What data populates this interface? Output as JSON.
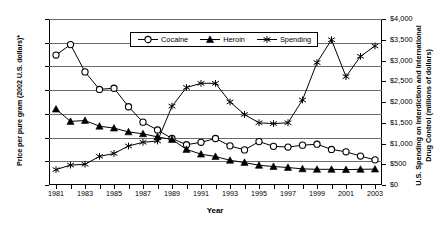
{
  "chart_data": {
    "type": "line",
    "title": "",
    "xlabel": "Year",
    "ylabel": "Price per pure gram (2002 U.S. dollars)*",
    "ylabel_right": "U.S. Spending on Interdiction and International Drug Control (millions of dollars)",
    "x": [
      1981,
      1982,
      1983,
      1984,
      1985,
      1986,
      1987,
      1988,
      1989,
      1990,
      1991,
      1992,
      1993,
      1994,
      1995,
      1996,
      1997,
      1998,
      1999,
      2000,
      2001,
      2002,
      2003
    ],
    "xtick_labels": [
      "1981",
      "1983",
      "1985",
      "1987",
      "1989",
      "1991",
      "1993",
      "1995",
      "1997",
      "1999",
      "2001",
      "2003"
    ],
    "ylim": [
      0,
      700
    ],
    "yticks": [
      0,
      100,
      200,
      300,
      400,
      500,
      600,
      700
    ],
    "ytick_labels": [
      "$-",
      "$100",
      "$200",
      "$300",
      "$400",
      "$500",
      "$600",
      "$700"
    ],
    "ylim_right": [
      0,
      4000
    ],
    "yticks_right": [
      0,
      500,
      1000,
      1500,
      2000,
      2500,
      3000,
      3500,
      4000
    ],
    "ytick_labels_right": [
      "$0",
      "$500",
      "$1,000",
      "$1,500",
      "$2,000",
      "$2,500",
      "$3,000",
      "$3,500",
      "$4,000"
    ],
    "grid": true,
    "legend_position": "top-center",
    "series": [
      {
        "name": "Cocaine",
        "axis": "left",
        "marker": "open-circle",
        "values": [
          548,
          592,
          477,
          403,
          408,
          330,
          265,
          232,
          196,
          170,
          180,
          196,
          165,
          148,
          183,
          163,
          160,
          168,
          172,
          150,
          140,
          122,
          106
        ]
      },
      {
        "name": "Heroin",
        "axis": "left",
        "marker": "filled-triangle",
        "values": [
          320,
          268,
          272,
          248,
          240,
          224,
          216,
          203,
          192,
          150,
          130,
          120,
          104,
          95,
          83,
          78,
          74,
          68,
          66,
          66,
          65,
          66,
          67
        ]
      },
      {
        "name": "Spending",
        "axis": "right",
        "marker": "asterisk",
        "values": [
          370,
          480,
          500,
          690,
          760,
          940,
          1030,
          1060,
          1900,
          2350,
          2450,
          2450,
          2000,
          1700,
          1500,
          1480,
          1500,
          2050,
          2950,
          3500,
          2610,
          3100,
          3350
        ]
      }
    ]
  },
  "legend": {
    "items": [
      {
        "label": "Cocaine",
        "marker": "open-circle"
      },
      {
        "label": "Heroin",
        "marker": "filled-triangle"
      },
      {
        "label": "Spending",
        "marker": "asterisk"
      }
    ]
  },
  "colors": {
    "line": "#000000",
    "grid": "#6b6b6b",
    "background": "#ffffff"
  }
}
